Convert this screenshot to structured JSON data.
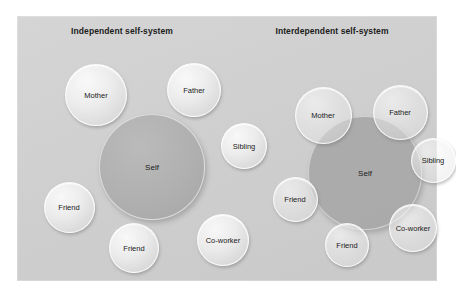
{
  "figure": {
    "kind": "conceptual-diagram",
    "background_color": "#ffffff",
    "plate_color": "#d0d0d0"
  },
  "panels": [
    {
      "id": "independent",
      "title": "Independent self-system",
      "self_overlaps_others": false,
      "nodes": [
        {
          "label": "Self",
          "role": "self",
          "x": 135,
          "y": 151,
          "d": 106
        },
        {
          "label": "Mother",
          "role": "satellite",
          "x": 79,
          "y": 79,
          "d": 62
        },
        {
          "label": "Father",
          "role": "satellite",
          "x": 177,
          "y": 74,
          "d": 54
        },
        {
          "label": "Sibling",
          "role": "satellite",
          "x": 227,
          "y": 130,
          "d": 46
        },
        {
          "label": "Friend",
          "role": "satellite",
          "x": 52,
          "y": 191,
          "d": 51
        },
        {
          "label": "Friend",
          "role": "satellite",
          "x": 117,
          "y": 232,
          "d": 50
        },
        {
          "label": "Co-worker",
          "role": "satellite",
          "x": 206,
          "y": 224,
          "d": 52
        }
      ]
    },
    {
      "id": "interdependent",
      "title": "Interdependent self-system",
      "self_overlaps_others": true,
      "nodes": [
        {
          "label": "Self",
          "role": "self",
          "x": 348,
          "y": 157,
          "d": 114
        },
        {
          "label": "Mother",
          "role": "satellite",
          "x": 306,
          "y": 99,
          "d": 57
        },
        {
          "label": "Father",
          "role": "satellite",
          "x": 383,
          "y": 96,
          "d": 55
        },
        {
          "label": "Sibling",
          "role": "satellite",
          "x": 416,
          "y": 144,
          "d": 45
        },
        {
          "label": "Friend",
          "role": "satellite",
          "x": 278,
          "y": 183,
          "d": 45
        },
        {
          "label": "Friend",
          "role": "satellite",
          "x": 330,
          "y": 229,
          "d": 44
        },
        {
          "label": "Co-worker",
          "role": "satellite",
          "x": 396,
          "y": 212,
          "d": 48
        }
      ]
    }
  ]
}
